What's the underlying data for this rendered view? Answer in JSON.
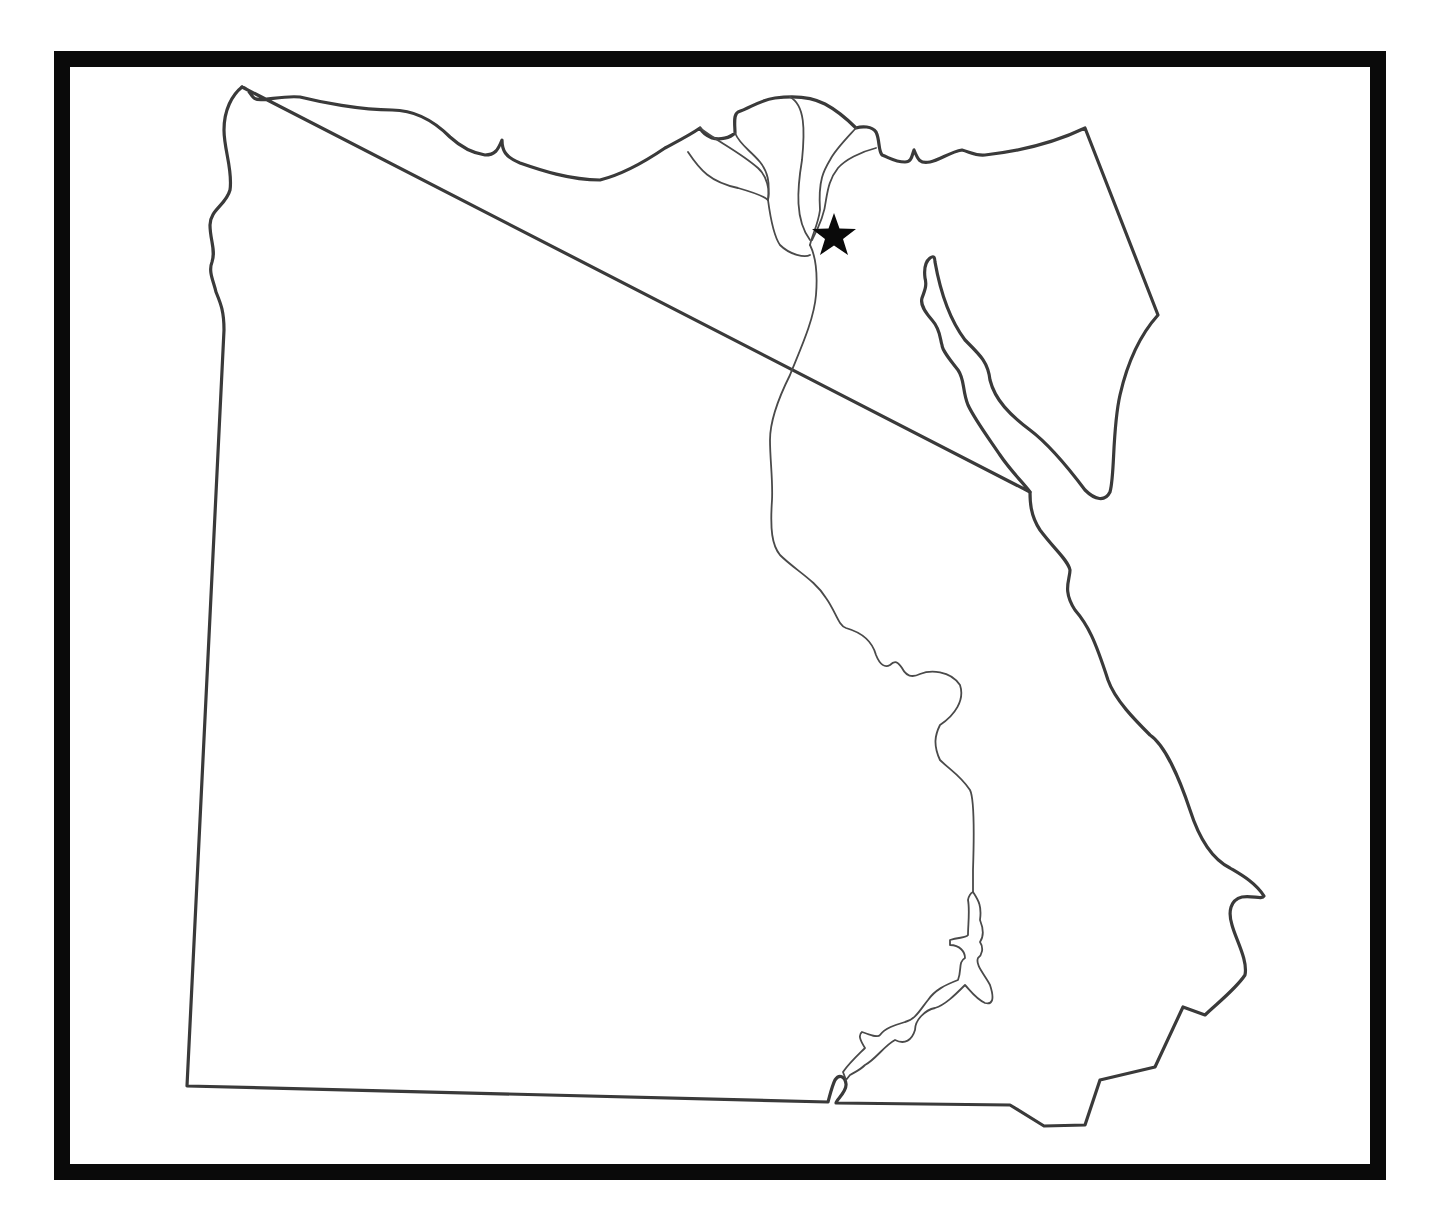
{
  "map": {
    "title": "Outline map of Egypt",
    "frame_color": "#0a0a0a",
    "outline_color": "#3a3a3a",
    "river_color": "#4a4a4a",
    "background": "#ffffff",
    "features": [
      {
        "name": "country-outline",
        "type": "border"
      },
      {
        "name": "sinai-peninsula",
        "type": "region"
      },
      {
        "name": "nile-river",
        "type": "river"
      },
      {
        "name": "nile-delta",
        "type": "river-delta"
      },
      {
        "name": "lake-nasser",
        "type": "lake"
      },
      {
        "name": "gulf-of-suez",
        "type": "water"
      }
    ],
    "markers": [
      {
        "name": "capital-star",
        "label": "",
        "shape": "star",
        "x": 834,
        "y": 235
      }
    ],
    "labels": []
  }
}
